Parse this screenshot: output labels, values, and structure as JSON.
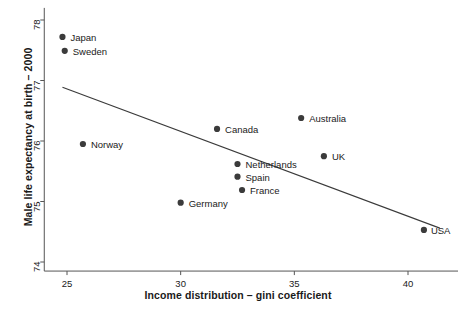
{
  "chart_data": {
    "type": "scatter",
    "title": "",
    "xlabel": "Income distribution – gini coefficient",
    "ylabel": "Male life expectancy at birth – 2000",
    "xlim": [
      24.0,
      42.2
    ],
    "ylim": [
      73.85,
      78.2
    ],
    "xticks": [
      25,
      30,
      35,
      40
    ],
    "xtick_labels": [
      "25",
      "30",
      "35",
      "40"
    ],
    "yticks": [
      74,
      75,
      76,
      77,
      78
    ],
    "ytick_labels": [
      "74",
      "75",
      "76",
      "77",
      "78"
    ],
    "grid": false,
    "legend": "none",
    "marker_color": "#3b3b3b",
    "line_color": "#3b3b3b",
    "axis_color": "#555555",
    "points": [
      {
        "label": "Japan",
        "x": 24.8,
        "y": 77.72,
        "label_dx": 8,
        "label_dy": -5
      },
      {
        "label": "Sweden",
        "x": 24.9,
        "y": 77.49,
        "label_dx": 8,
        "label_dy": -5
      },
      {
        "label": "Norway",
        "x": 25.7,
        "y": 75.95,
        "label_dx": 8,
        "label_dy": -5
      },
      {
        "label": "Germany",
        "x": 30.0,
        "y": 74.98,
        "label_dx": 8,
        "label_dy": -5
      },
      {
        "label": "Canada",
        "x": 31.6,
        "y": 76.2,
        "label_dx": 8,
        "label_dy": -5
      },
      {
        "label": "Netherlands",
        "x": 32.5,
        "y": 75.62,
        "label_dx": 8,
        "label_dy": -5
      },
      {
        "label": "Spain",
        "x": 32.5,
        "y": 75.41,
        "label_dx": 8,
        "label_dy": -5
      },
      {
        "label": "France",
        "x": 32.7,
        "y": 75.19,
        "label_dx": 8,
        "label_dy": -5
      },
      {
        "label": "Australia",
        "x": 35.3,
        "y": 76.38,
        "label_dx": 8,
        "label_dy": -5
      },
      {
        "label": "UK",
        "x": 36.3,
        "y": 75.75,
        "label_dx": 8,
        "label_dy": -5
      },
      {
        "label": "USA",
        "x": 40.7,
        "y": 74.53,
        "label_dx": 7,
        "label_dy": -5
      }
    ],
    "trendline": {
      "x0": 24.8,
      "y0": 76.89,
      "x1": 41.4,
      "y1": 74.56
    }
  }
}
